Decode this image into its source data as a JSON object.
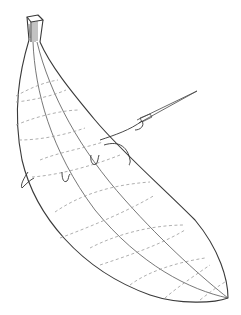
{
  "figure": {
    "colors": {
      "background": "#ffffff",
      "outline": "#3a3a3a",
      "contour": "#9a9a9a",
      "thread": "#333333"
    },
    "elements": [
      "banana-outline",
      "banana-stem",
      "ridge-lines",
      "dashed-contours",
      "needle",
      "thread",
      "stitch-loops"
    ]
  }
}
